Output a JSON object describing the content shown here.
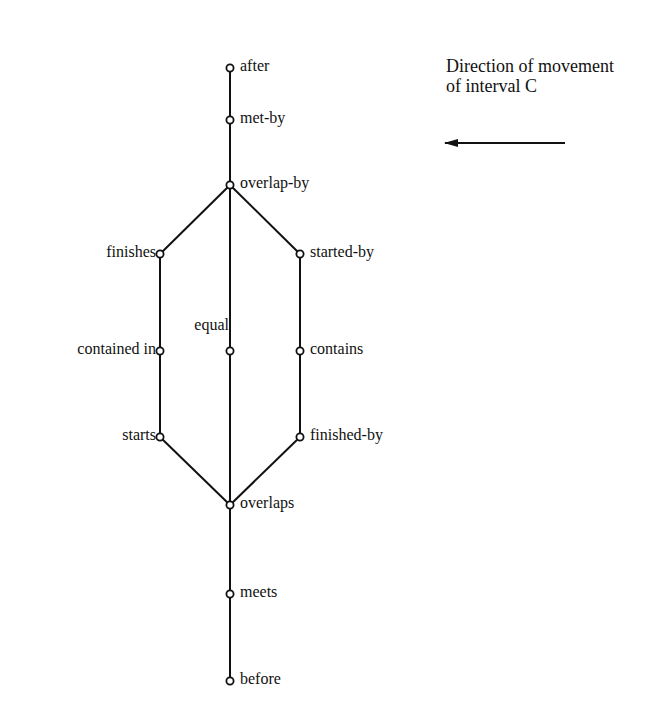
{
  "caption": {
    "line1": "Direction of movement",
    "line2": "of interval C"
  },
  "arrow": {
    "direction": "left",
    "x1": 565,
    "y1": 143,
    "x2": 445,
    "y2": 143
  },
  "colors": {
    "line": "#111111",
    "background": "#ffffff"
  },
  "nodes": [
    {
      "id": "after",
      "label": "after",
      "x": 230,
      "y": 68,
      "side": "right"
    },
    {
      "id": "met-by",
      "label": "met-by",
      "x": 230,
      "y": 120,
      "side": "right"
    },
    {
      "id": "overlap-by",
      "label": "overlap-by",
      "x": 230,
      "y": 185,
      "side": "right"
    },
    {
      "id": "finishes",
      "label": "finishes",
      "x": 160,
      "y": 254,
      "side": "left"
    },
    {
      "id": "started-by",
      "label": "started-by",
      "x": 300,
      "y": 254,
      "side": "right"
    },
    {
      "id": "contained-in",
      "label": "contained in",
      "x": 160,
      "y": 351,
      "side": "left"
    },
    {
      "id": "equal",
      "label": "equal",
      "x": 230,
      "y": 351,
      "side": "above-left"
    },
    {
      "id": "contains",
      "label": "contains",
      "x": 300,
      "y": 351,
      "side": "right"
    },
    {
      "id": "starts",
      "label": "starts",
      "x": 160,
      "y": 437,
      "side": "left"
    },
    {
      "id": "finished-by",
      "label": "finished-by",
      "x": 300,
      "y": 437,
      "side": "right"
    },
    {
      "id": "overlaps",
      "label": "overlaps",
      "x": 230,
      "y": 505,
      "side": "right"
    },
    {
      "id": "meets",
      "label": "meets",
      "x": 230,
      "y": 594,
      "side": "right"
    },
    {
      "id": "before",
      "label": "before",
      "x": 230,
      "y": 681,
      "side": "right"
    }
  ],
  "edges": [
    [
      "after",
      "met-by"
    ],
    [
      "met-by",
      "overlap-by"
    ],
    [
      "overlap-by",
      "finishes"
    ],
    [
      "overlap-by",
      "equal"
    ],
    [
      "overlap-by",
      "started-by"
    ],
    [
      "finishes",
      "contained-in"
    ],
    [
      "contained-in",
      "starts"
    ],
    [
      "started-by",
      "contains"
    ],
    [
      "contains",
      "finished-by"
    ],
    [
      "equal",
      "overlaps"
    ],
    [
      "starts",
      "overlaps"
    ],
    [
      "finished-by",
      "overlaps"
    ],
    [
      "overlaps",
      "meets"
    ],
    [
      "meets",
      "before"
    ]
  ]
}
